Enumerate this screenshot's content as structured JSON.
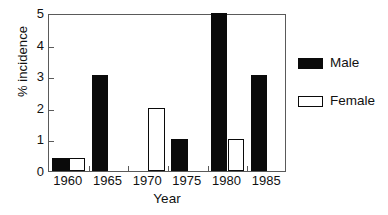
{
  "chart_data": {
    "type": "bar",
    "title": "",
    "subtitle": "",
    "xlabel": "Year",
    "ylabel": "% incidence",
    "categories": [
      "1960",
      "1965",
      "1970",
      "1975",
      "1980",
      "1985"
    ],
    "series": [
      {
        "name": "Male",
        "color": "#0a0a0a",
        "fill": "solid",
        "values": [
          0.4,
          3.05,
          0,
          1.0,
          5.0,
          3.05
        ]
      },
      {
        "name": "Female",
        "color": "#ffffff",
        "fill": "outline",
        "values": [
          0.4,
          0,
          2.0,
          0,
          1.0,
          0
        ]
      }
    ],
    "ylim": [
      0,
      5
    ],
    "yticks": [
      0,
      1,
      2,
      3,
      4,
      5
    ],
    "ytick_labels": [
      "0",
      "1",
      "2",
      "3",
      "4",
      "5"
    ],
    "grid": false,
    "legend_position": "right"
  },
  "legend": {
    "entries": [
      {
        "label": "Male",
        "swatch": "black-filled-swatch"
      },
      {
        "label": "Female",
        "swatch": "white-outlined-swatch"
      }
    ]
  },
  "axes": {
    "y_title": "% incidence",
    "x_title": "Year"
  }
}
